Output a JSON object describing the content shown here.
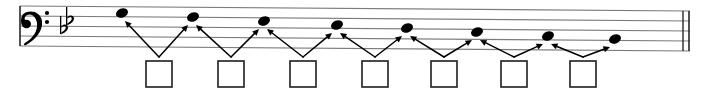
{
  "document": {
    "kind": "music-notation-exercise",
    "title": "Melodic interval identification exercise",
    "instruction_boxes_count": 7
  },
  "staff": {
    "clef": "bass-clef",
    "clef_symbol": "𝄢",
    "key_signature": {
      "name": "two-flats",
      "accidental_symbol": "♭",
      "count": 2,
      "key": "B-flat major / G minor"
    },
    "line_count": 5,
    "line_spacing_px": 10,
    "top_line_y": 6,
    "left_x": 20,
    "right_x": 690,
    "end_barline": "double-barline"
  },
  "notes": [
    {
      "index": 1,
      "x": 122,
      "y": 13,
      "staff_position": "line-2-from-top",
      "pitch": "A3"
    },
    {
      "index": 2,
      "x": 193,
      "y": 17,
      "staff_position": "space-2",
      "pitch": "G3"
    },
    {
      "index": 3,
      "x": 264,
      "y": 21,
      "staff_position": "line-3",
      "pitch": "F3"
    },
    {
      "index": 4,
      "x": 337,
      "y": 25,
      "staff_position": "space-3",
      "pitch": "E3"
    },
    {
      "index": 5,
      "x": 407,
      "y": 28,
      "staff_position": "line-4",
      "pitch": "D3"
    },
    {
      "index": 6,
      "x": 477,
      "y": 32,
      "staff_position": "space-4",
      "pitch": "C3"
    },
    {
      "index": 7,
      "x": 548,
      "y": 36,
      "staff_position": "line-5",
      "pitch": "B2"
    },
    {
      "index": 8,
      "x": 615,
      "y": 39,
      "staff_position": "below-line-5",
      "pitch": "A2"
    }
  ],
  "answer_boxes": [
    {
      "index": 1,
      "x": 146,
      "y": 61,
      "width": 26,
      "height": 26,
      "value": "",
      "connects_notes": [
        1,
        2
      ]
    },
    {
      "index": 2,
      "x": 218,
      "y": 61,
      "width": 26,
      "height": 26,
      "value": "",
      "connects_notes": [
        2,
        3
      ]
    },
    {
      "index": 3,
      "x": 290,
      "y": 61,
      "width": 26,
      "height": 26,
      "value": "",
      "connects_notes": [
        3,
        4
      ]
    },
    {
      "index": 4,
      "x": 362,
      "y": 61,
      "width": 26,
      "height": 26,
      "value": "",
      "connects_notes": [
        4,
        5
      ]
    },
    {
      "index": 5,
      "x": 431,
      "y": 61,
      "width": 26,
      "height": 26,
      "value": "",
      "connects_notes": [
        5,
        6
      ]
    },
    {
      "index": 6,
      "x": 501,
      "y": 61,
      "width": 26,
      "height": 26,
      "value": "",
      "connects_notes": [
        6,
        7
      ]
    },
    {
      "index": 7,
      "x": 570,
      "y": 61,
      "width": 26,
      "height": 26,
      "value": "",
      "connects_notes": [
        7,
        8
      ]
    }
  ],
  "colors": {
    "ink": "#000000",
    "staff_line": "#7c7c7c",
    "box_stroke": "#2b2b2b",
    "paper": "#ffffff"
  }
}
